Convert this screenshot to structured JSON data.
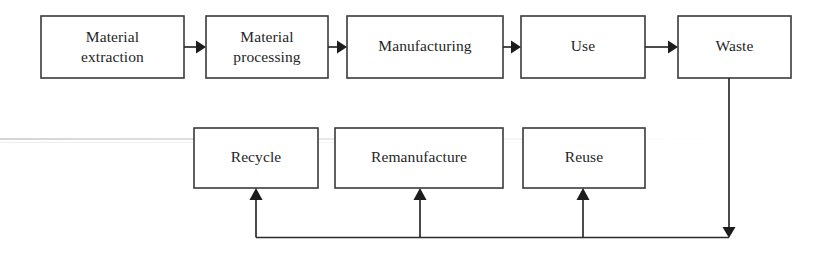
{
  "diagram": {
    "type": "flowchart",
    "background_color": "#ffffff",
    "box_stroke_color": "#3a3a3a",
    "line_color": "#2b2b2b",
    "text_color": "#262626",
    "linear_flow": [
      {
        "id": "material-extraction",
        "label": "Material\nextraction",
        "lines": [
          "Material",
          "extraction"
        ],
        "x": 41,
        "y": 16,
        "w": 143,
        "h": 62
      },
      {
        "id": "material-processing",
        "label": "Material\nprocessing",
        "lines": [
          "Material",
          "processing"
        ],
        "x": 206,
        "y": 16,
        "w": 122,
        "h": 62
      },
      {
        "id": "manufacturing",
        "label": "Manufacturing",
        "lines": [
          "Manufacturing"
        ],
        "x": 347,
        "y": 16,
        "w": 156,
        "h": 62
      },
      {
        "id": "use",
        "label": "Use",
        "lines": [
          "Use"
        ],
        "x": 521,
        "y": 16,
        "w": 124,
        "h": 62
      },
      {
        "id": "waste",
        "label": "Waste",
        "lines": [
          "Waste"
        ],
        "x": 678,
        "y": 16,
        "w": 113,
        "h": 62
      }
    ],
    "recovery_options": [
      {
        "id": "recycle",
        "label": "Recycle",
        "lines": [
          "Recycle"
        ],
        "x": 194,
        "y": 128,
        "w": 124,
        "h": 60
      },
      {
        "id": "remanufacture",
        "label": "Remanufacture",
        "lines": [
          "Remanufacture"
        ],
        "x": 335,
        "y": 128,
        "w": 168,
        "h": 60
      },
      {
        "id": "reuse",
        "label": "Reuse",
        "lines": [
          "Reuse"
        ],
        "x": 523,
        "y": 128,
        "w": 122,
        "h": 60
      }
    ],
    "connectors": [
      {
        "id": "arrow-extraction-to-processing",
        "kind": "horizontal-arrow",
        "from": "material-extraction",
        "to": "material-processing"
      },
      {
        "id": "arrow-processing-to-manufacturing",
        "kind": "horizontal-arrow",
        "from": "material-processing",
        "to": "manufacturing"
      },
      {
        "id": "arrow-manufacturing-to-use",
        "kind": "horizontal-arrow",
        "from": "manufacturing",
        "to": "use"
      },
      {
        "id": "arrow-use-to-waste",
        "kind": "horizontal-arrow",
        "from": "use",
        "to": "waste"
      },
      {
        "id": "feedback-waste-down",
        "kind": "vertical-arrow-down",
        "from": "waste",
        "to": "return-bus"
      },
      {
        "id": "arrow-bus-to-recycle",
        "kind": "vertical-arrow-up",
        "from": "return-bus",
        "to": "recycle"
      },
      {
        "id": "arrow-bus-to-remanufacture",
        "kind": "vertical-arrow-up",
        "from": "return-bus",
        "to": "remanufacture"
      },
      {
        "id": "arrow-bus-to-reuse",
        "kind": "vertical-arrow-up",
        "from": "return-bus",
        "to": "reuse"
      },
      {
        "id": "return-bus",
        "kind": "horizontal-line",
        "from": "feedback-waste-down",
        "to": "arrow-bus-to-recycle"
      }
    ]
  }
}
